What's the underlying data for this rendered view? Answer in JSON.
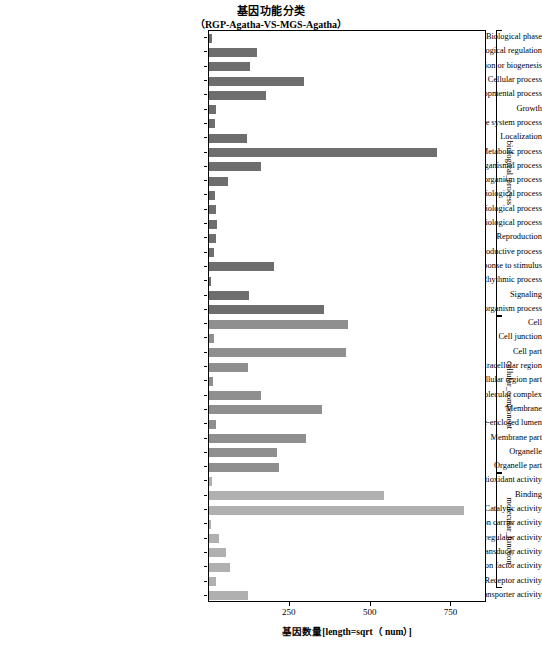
{
  "title": {
    "main": "基因功能分类",
    "sub": "（RGP-Agatha-VS-MGS-Agatha）"
  },
  "axis": {
    "x_title": "基因数量[length=sqrt（ num）]",
    "x_ticks": [
      "250",
      "500",
      "750"
    ],
    "x_tick_values": [
      250,
      500,
      750
    ]
  },
  "groups": [
    {
      "label": "biological_process",
      "start": 0,
      "end": 19
    },
    {
      "label": "cellular_component",
      "start": 20,
      "end": 30
    },
    {
      "label": "molecular_function",
      "start": 31,
      "end": 38
    }
  ],
  "colors": {
    "biological_process": "#6e6e6e",
    "cellular_component": "#8f8f8f",
    "molecular_function": "#b0b0b0",
    "axis": "#000000",
    "background": "#ffffff"
  },
  "chart_data": {
    "type": "bar",
    "orientation": "horizontal",
    "xlabel": "基因数量[length=sqrt（ num）]",
    "ylabel": "",
    "xlim": [
      0,
      860
    ],
    "grid": false,
    "legend": "right-side group brackets",
    "categories": [
      "Biological phase",
      "Biological regulation",
      "Cellular component organization or biogenesis",
      "Cellular process",
      "Developmental process",
      "Growth",
      "Immune system process",
      "Localization",
      "Metabolic process",
      "Multicellular organismal process",
      "Multi-organism process",
      "Negative regulation of biological process",
      "Positive regulation of biological process",
      "Regulation of biological process",
      "Reproduction",
      "Reproductive process",
      "Response to stimulus",
      "Rhythmic process",
      "Signaling",
      "Single-organism process",
      "Cell",
      "Cell junction",
      "Cell part",
      "Extracellular region",
      "Extracellular region part",
      "Macromolecular complex",
      "Membrane",
      "Membrane-enclosed lumen",
      "Membrane part",
      "Organelle",
      "Organelle part",
      "Antioxidant activity",
      "Binding",
      "Catalytic activity",
      "Electron carrier activity",
      "Enzyme regulator activity",
      "Molecular transducer activity",
      "Nucleic acid binding transcription factor activity",
      "Receptor activity",
      "Transporter activity"
    ],
    "values": [
      8,
      150,
      128,
      295,
      175,
      22,
      18,
      118,
      705,
      160,
      58,
      20,
      22,
      26,
      22,
      14,
      200,
      6,
      125,
      355,
      430,
      16,
      425,
      120,
      12,
      160,
      350,
      22,
      300,
      210,
      215,
      10,
      540,
      790,
      4,
      32,
      52,
      65,
      22,
      120
    ],
    "group_of_category": [
      "biological_process",
      "biological_process",
      "biological_process",
      "biological_process",
      "biological_process",
      "biological_process",
      "biological_process",
      "biological_process",
      "biological_process",
      "biological_process",
      "biological_process",
      "biological_process",
      "biological_process",
      "biological_process",
      "biological_process",
      "biological_process",
      "biological_process",
      "biological_process",
      "biological_process",
      "biological_process",
      "cellular_component",
      "cellular_component",
      "cellular_component",
      "cellular_component",
      "cellular_component",
      "cellular_component",
      "cellular_component",
      "cellular_component",
      "cellular_component",
      "cellular_component",
      "cellular_component",
      "molecular_function",
      "molecular_function",
      "molecular_function",
      "molecular_function",
      "molecular_function",
      "molecular_function",
      "molecular_function",
      "molecular_function",
      "molecular_function"
    ]
  }
}
